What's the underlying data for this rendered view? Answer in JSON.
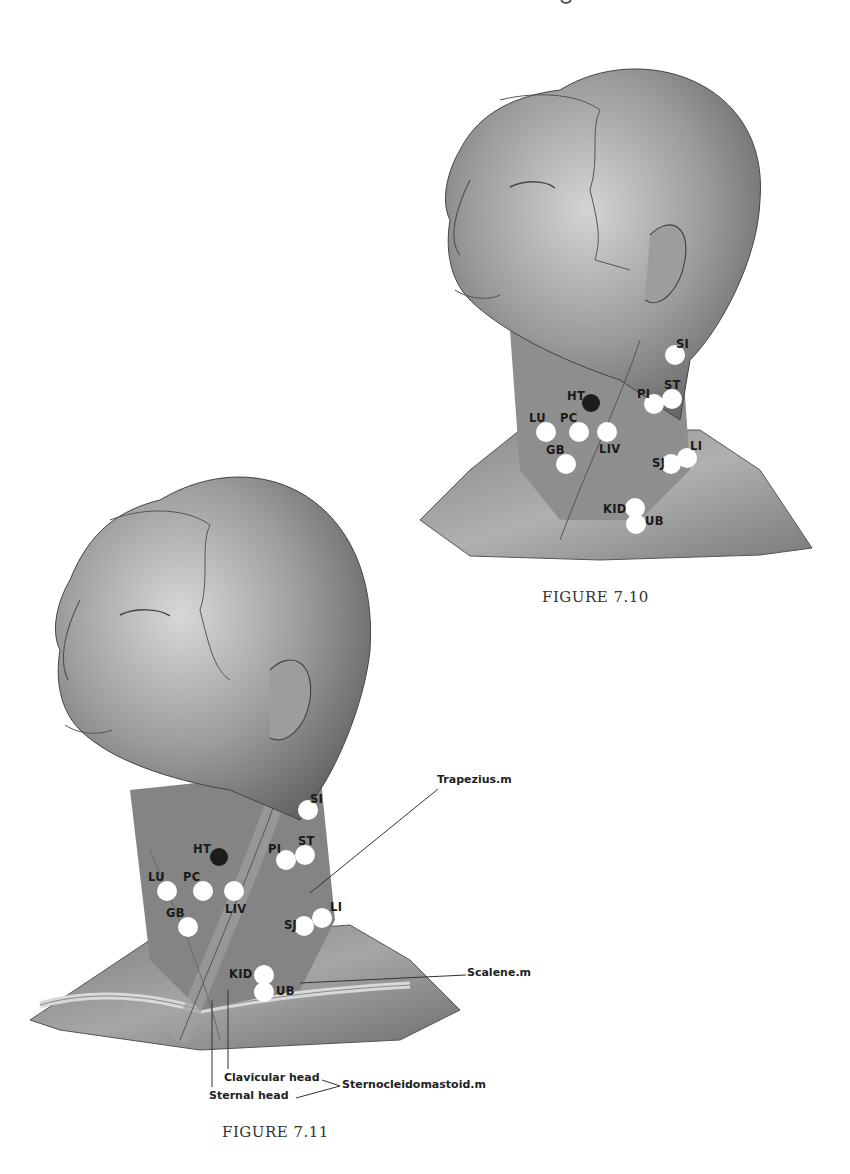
{
  "page_fragment": "g",
  "figures": [
    {
      "id": "fig_7_10",
      "caption": "FIGURE 7.10",
      "points": [
        {
          "label": "SI",
          "x": 675,
          "y": 355,
          "lx": 676,
          "ly": 337,
          "dark": false
        },
        {
          "label": "HT",
          "x": 591,
          "y": 403,
          "lx": 567,
          "ly": 389,
          "dark": true
        },
        {
          "label": "PI",
          "x": 654,
          "y": 404,
          "lx": 637,
          "ly": 387,
          "dark": false
        },
        {
          "label": "ST",
          "x": 672,
          "y": 399,
          "lx": 664,
          "ly": 378,
          "dark": false
        },
        {
          "label": "LU",
          "x": 546,
          "y": 432,
          "lx": 529,
          "ly": 411,
          "dark": false
        },
        {
          "label": "PC",
          "x": 579,
          "y": 432,
          "lx": 560,
          "ly": 411,
          "dark": false
        },
        {
          "label": "LIV",
          "x": 607,
          "y": 432,
          "lx": 599,
          "ly": 442,
          "dark": false
        },
        {
          "label": "GB",
          "x": 566,
          "y": 464,
          "lx": 546,
          "ly": 443,
          "dark": false
        },
        {
          "label": "LI",
          "x": 687,
          "y": 458,
          "lx": 690,
          "ly": 439,
          "dark": false
        },
        {
          "label": "SJ",
          "x": 671,
          "y": 464,
          "lx": 652,
          "ly": 456,
          "dark": false
        },
        {
          "label": "KID",
          "x": 635,
          "y": 508,
          "lx": 603,
          "ly": 502,
          "dark": false
        },
        {
          "label": "UB",
          "x": 636,
          "y": 524,
          "lx": 645,
          "ly": 514,
          "dark": false
        }
      ]
    },
    {
      "id": "fig_7_11",
      "caption": "FIGURE 7.11",
      "points": [
        {
          "label": "SI",
          "x": 308,
          "y": 810,
          "lx": 310,
          "ly": 792,
          "dark": false
        },
        {
          "label": "HT",
          "x": 219,
          "y": 857,
          "lx": 193,
          "ly": 842,
          "dark": true
        },
        {
          "label": "PI",
          "x": 286,
          "y": 860,
          "lx": 268,
          "ly": 842,
          "dark": false
        },
        {
          "label": "ST",
          "x": 305,
          "y": 855,
          "lx": 298,
          "ly": 834,
          "dark": false
        },
        {
          "label": "LU",
          "x": 167,
          "y": 891,
          "lx": 148,
          "ly": 870,
          "dark": false
        },
        {
          "label": "PC",
          "x": 203,
          "y": 891,
          "lx": 183,
          "ly": 870,
          "dark": false
        },
        {
          "label": "LIV",
          "x": 234,
          "y": 891,
          "lx": 225,
          "ly": 902,
          "dark": false
        },
        {
          "label": "GB",
          "x": 188,
          "y": 927,
          "lx": 166,
          "ly": 906,
          "dark": false
        },
        {
          "label": "LI",
          "x": 322,
          "y": 918,
          "lx": 330,
          "ly": 900,
          "dark": false
        },
        {
          "label": "SJ",
          "x": 304,
          "y": 926,
          "lx": 284,
          "ly": 918,
          "dark": false
        },
        {
          "label": "KID",
          "x": 264,
          "y": 975,
          "lx": 229,
          "ly": 967,
          "dark": false
        },
        {
          "label": "UB",
          "x": 264,
          "y": 992,
          "lx": 276,
          "ly": 984,
          "dark": false
        }
      ],
      "annotations": {
        "trapezius": "Trapezius.m",
        "scalene": "Scalene.m",
        "clavicular_head": "Clavicular head",
        "sternal_head": "Sternal head",
        "sternocleidomastoid": "Sternocleidomastoid.m"
      }
    }
  ],
  "colors": {
    "skin_dark": "#5a5a5a",
    "skin_mid": "#8c8c8c",
    "skin_light": "#c8c8c8",
    "point_white": "#ffffff",
    "point_dark": "#1c1c1c"
  }
}
